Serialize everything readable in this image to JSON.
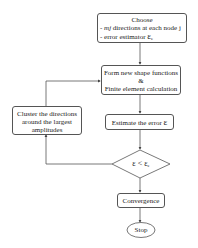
{
  "flowchart": {
    "choose": {
      "title": "Choose",
      "line1_var": "mj",
      "line1_text": "directions at each node j",
      "line2_text": "error estimator",
      "line2_symbol": "ε",
      "line2_sub": "e",
      "bullet": "-"
    },
    "form": {
      "line1": "Form new shape functions",
      "line2": "&",
      "line3": "Finite element calculation"
    },
    "estimate": {
      "text": "Estimate the error",
      "symbol": "ε"
    },
    "decision": {
      "lhs": "ε",
      "op": "<",
      "rhs": "ε",
      "rhs_sub": "e"
    },
    "cluster": {
      "line1": "Cluster the directions",
      "line2": "around the largest",
      "line3": "amplitudes"
    },
    "convergence": {
      "text": "Convergence"
    },
    "stop": {
      "text": "Stop"
    }
  }
}
